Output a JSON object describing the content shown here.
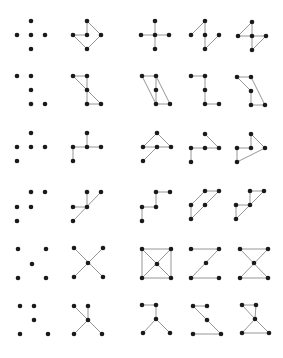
{
  "figure": {
    "colors": {
      "background": "#ffffff",
      "point": "#1a1a1a",
      "edge": "#8a8a8a"
    },
    "point_radius": 2.3,
    "edge_width": 0.9,
    "panels": [
      {
        "row": 1,
        "col": 1,
        "points": [
          [
            31,
            21
          ],
          [
            17,
            35
          ],
          [
            31,
            35
          ],
          [
            45,
            35
          ],
          [
            31,
            49
          ]
        ],
        "edges": []
      },
      {
        "row": 1,
        "col": 2,
        "points": [
          [
            87,
            21
          ],
          [
            73,
            35
          ],
          [
            87,
            35
          ],
          [
            101,
            35
          ],
          [
            87,
            49
          ]
        ],
        "edges": [
          [
            0,
            3
          ],
          [
            3,
            4
          ],
          [
            4,
            1
          ],
          [
            1,
            2
          ],
          [
            2,
            0
          ]
        ]
      },
      {
        "row": 1,
        "col": 3,
        "points": [
          [
            155,
            21
          ],
          [
            141,
            35
          ],
          [
            155,
            35
          ],
          [
            169,
            35
          ],
          [
            155,
            49
          ]
        ],
        "edges": [
          [
            0,
            2
          ],
          [
            2,
            4
          ],
          [
            1,
            2
          ],
          [
            2,
            3
          ]
        ]
      },
      {
        "row": 1,
        "col": 4,
        "points": [
          [
            205,
            21
          ],
          [
            191,
            35
          ],
          [
            205,
            35
          ],
          [
            219,
            35
          ],
          [
            205,
            49
          ]
        ],
        "edges": [
          [
            0,
            1
          ],
          [
            0,
            2
          ],
          [
            2,
            4
          ],
          [
            4,
            3
          ]
        ]
      },
      {
        "row": 1,
        "col": 5,
        "points": [
          [
            252,
            22
          ],
          [
            238,
            36
          ],
          [
            252,
            36
          ],
          [
            266,
            36
          ],
          [
            252,
            50
          ]
        ],
        "edges": [
          [
            0,
            1
          ],
          [
            1,
            2
          ],
          [
            2,
            3
          ],
          [
            0,
            2
          ],
          [
            3,
            4
          ],
          [
            2,
            4
          ]
        ]
      },
      {
        "row": 2,
        "col": 1,
        "points": [
          [
            17,
            76
          ],
          [
            31,
            76
          ],
          [
            31,
            90
          ],
          [
            31,
            104
          ],
          [
            45,
            104
          ]
        ],
        "edges": []
      },
      {
        "row": 2,
        "col": 2,
        "points": [
          [
            73,
            76
          ],
          [
            87,
            76
          ],
          [
            87,
            90
          ],
          [
            87,
            104
          ],
          [
            101,
            104
          ]
        ],
        "edges": [
          [
            0,
            1
          ],
          [
            1,
            3
          ],
          [
            0,
            4
          ],
          [
            3,
            4
          ]
        ]
      },
      {
        "row": 2,
        "col": 3,
        "points": [
          [
            142,
            76
          ],
          [
            156,
            76
          ],
          [
            156,
            90
          ],
          [
            156,
            104
          ],
          [
            170,
            104
          ]
        ],
        "edges": [
          [
            0,
            1
          ],
          [
            0,
            3
          ],
          [
            1,
            4
          ],
          [
            1,
            3
          ],
          [
            3,
            4
          ]
        ]
      },
      {
        "row": 2,
        "col": 4,
        "points": [
          [
            191,
            76
          ],
          [
            205,
            76
          ],
          [
            205,
            90
          ],
          [
            205,
            104
          ],
          [
            219,
            104
          ]
        ],
        "edges": [
          [
            0,
            1
          ],
          [
            1,
            3
          ],
          [
            3,
            4
          ]
        ]
      },
      {
        "row": 2,
        "col": 5,
        "points": [
          [
            237,
            77
          ],
          [
            251,
            77
          ],
          [
            251,
            91
          ],
          [
            251,
            105
          ],
          [
            265,
            105
          ]
        ],
        "edges": [
          [
            0,
            1
          ],
          [
            0,
            2
          ],
          [
            2,
            3
          ],
          [
            1,
            4
          ],
          [
            3,
            4
          ]
        ]
      },
      {
        "row": 3,
        "col": 1,
        "points": [
          [
            31,
            133
          ],
          [
            17,
            147
          ],
          [
            31,
            147
          ],
          [
            45,
            147
          ],
          [
            17,
            161
          ]
        ],
        "edges": []
      },
      {
        "row": 3,
        "col": 2,
        "points": [
          [
            87,
            133
          ],
          [
            73,
            147
          ],
          [
            87,
            147
          ],
          [
            101,
            147
          ],
          [
            73,
            161
          ]
        ],
        "edges": [
          [
            0,
            2
          ],
          [
            1,
            3
          ],
          [
            1,
            4
          ]
        ]
      },
      {
        "row": 3,
        "col": 3,
        "points": [
          [
            157,
            133
          ],
          [
            143,
            147
          ],
          [
            157,
            147
          ],
          [
            171,
            147
          ],
          [
            143,
            161
          ]
        ],
        "edges": [
          [
            0,
            1
          ],
          [
            0,
            3
          ],
          [
            1,
            3
          ],
          [
            2,
            4
          ]
        ]
      },
      {
        "row": 3,
        "col": 4,
        "points": [
          [
            205,
            134
          ],
          [
            191,
            148
          ],
          [
            205,
            148
          ],
          [
            219,
            148
          ],
          [
            191,
            162
          ]
        ],
        "edges": [
          [
            0,
            3
          ],
          [
            1,
            3
          ],
          [
            1,
            4
          ]
        ]
      },
      {
        "row": 3,
        "col": 5,
        "points": [
          [
            251,
            134
          ],
          [
            237,
            148
          ],
          [
            251,
            148
          ],
          [
            265,
            148
          ],
          [
            237,
            162
          ]
        ],
        "edges": [
          [
            0,
            3
          ],
          [
            0,
            2
          ],
          [
            1,
            2
          ],
          [
            1,
            4
          ],
          [
            4,
            3
          ]
        ]
      },
      {
        "row": 4,
        "col": 1,
        "points": [
          [
            31,
            192
          ],
          [
            45,
            192
          ],
          [
            17,
            207
          ],
          [
            31,
            207
          ],
          [
            17,
            221
          ]
        ],
        "edges": []
      },
      {
        "row": 4,
        "col": 2,
        "points": [
          [
            87,
            192
          ],
          [
            101,
            192
          ],
          [
            73,
            207
          ],
          [
            87,
            207
          ],
          [
            73,
            221
          ]
        ],
        "edges": [
          [
            0,
            3
          ],
          [
            1,
            4
          ],
          [
            2,
            3
          ]
        ]
      },
      {
        "row": 4,
        "col": 3,
        "points": [
          [
            156,
            192
          ],
          [
            170,
            192
          ],
          [
            142,
            207
          ],
          [
            156,
            207
          ],
          [
            142,
            221
          ]
        ],
        "edges": [
          [
            0,
            1
          ],
          [
            0,
            3
          ],
          [
            2,
            3
          ],
          [
            2,
            4
          ]
        ]
      },
      {
        "row": 4,
        "col": 4,
        "points": [
          [
            205,
            191
          ],
          [
            219,
            191
          ],
          [
            191,
            205
          ],
          [
            205,
            205
          ],
          [
            191,
            219
          ]
        ],
        "edges": [
          [
            0,
            1
          ],
          [
            0,
            2
          ],
          [
            2,
            4
          ],
          [
            1,
            4
          ]
        ]
      },
      {
        "row": 4,
        "col": 5,
        "points": [
          [
            250,
            191
          ],
          [
            264,
            191
          ],
          [
            236,
            205
          ],
          [
            250,
            205
          ],
          [
            236,
            219
          ]
        ],
        "edges": [
          [
            0,
            1
          ],
          [
            0,
            3
          ],
          [
            2,
            3
          ],
          [
            2,
            4
          ],
          [
            1,
            4
          ]
        ]
      },
      {
        "row": 5,
        "col": 1,
        "points": [
          [
            18,
            249
          ],
          [
            46,
            249
          ],
          [
            32,
            264
          ],
          [
            18,
            278
          ],
          [
            46,
            278
          ]
        ],
        "edges": []
      },
      {
        "row": 5,
        "col": 2,
        "points": [
          [
            74,
            248
          ],
          [
            103,
            248
          ],
          [
            88,
            263
          ],
          [
            74,
            277
          ],
          [
            103,
            277
          ]
        ],
        "edges": [
          [
            0,
            4
          ],
          [
            1,
            3
          ]
        ]
      },
      {
        "row": 5,
        "col": 3,
        "points": [
          [
            142,
            249
          ],
          [
            171,
            249
          ],
          [
            157,
            264
          ],
          [
            142,
            278
          ],
          [
            171,
            278
          ]
        ],
        "edges": [
          [
            0,
            1
          ],
          [
            1,
            4
          ],
          [
            4,
            3
          ],
          [
            3,
            0
          ],
          [
            0,
            4
          ],
          [
            1,
            3
          ]
        ]
      },
      {
        "row": 5,
        "col": 4,
        "points": [
          [
            191,
            249
          ],
          [
            219,
            249
          ],
          [
            206,
            263
          ],
          [
            191,
            278
          ],
          [
            219,
            278
          ]
        ],
        "edges": [
          [
            0,
            1
          ],
          [
            1,
            3
          ],
          [
            3,
            4
          ]
        ]
      },
      {
        "row": 5,
        "col": 5,
        "points": [
          [
            240,
            249
          ],
          [
            268,
            249
          ],
          [
            254,
            263
          ],
          [
            240,
            278
          ],
          [
            268,
            278
          ]
        ],
        "edges": [
          [
            0,
            1
          ],
          [
            3,
            4
          ],
          [
            0,
            4
          ],
          [
            1,
            3
          ]
        ]
      },
      {
        "row": 6,
        "col": 1,
        "points": [
          [
            20,
            306
          ],
          [
            34,
            306
          ],
          [
            34,
            320
          ],
          [
            20,
            334
          ],
          [
            48,
            334
          ]
        ],
        "edges": []
      },
      {
        "row": 6,
        "col": 2,
        "points": [
          [
            74,
            306
          ],
          [
            88,
            306
          ],
          [
            88,
            320
          ],
          [
            74,
            334
          ],
          [
            102,
            334
          ]
        ],
        "edges": [
          [
            0,
            4
          ],
          [
            1,
            2
          ],
          [
            2,
            3
          ]
        ]
      },
      {
        "row": 6,
        "col": 3,
        "points": [
          [
            142,
            305
          ],
          [
            156,
            305
          ],
          [
            156,
            319
          ],
          [
            143,
            333
          ],
          [
            170,
            333
          ]
        ],
        "edges": [
          [
            0,
            1
          ],
          [
            1,
            2
          ],
          [
            2,
            3
          ],
          [
            2,
            4
          ]
        ]
      },
      {
        "row": 6,
        "col": 4,
        "points": [
          [
            193,
            306
          ],
          [
            207,
            306
          ],
          [
            207,
            320
          ],
          [
            193,
            334
          ],
          [
            221,
            334
          ]
        ],
        "edges": [
          [
            0,
            1
          ],
          [
            0,
            4
          ],
          [
            3,
            4
          ]
        ]
      },
      {
        "row": 6,
        "col": 5,
        "points": [
          [
            242,
            305
          ],
          [
            256,
            305
          ],
          [
            255,
            319
          ],
          [
            242,
            333
          ],
          [
            269,
            333
          ]
        ],
        "edges": [
          [
            0,
            1
          ],
          [
            0,
            2
          ],
          [
            1,
            2
          ],
          [
            2,
            3
          ],
          [
            2,
            4
          ],
          [
            3,
            4
          ]
        ]
      }
    ]
  }
}
